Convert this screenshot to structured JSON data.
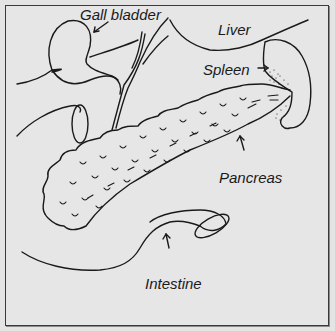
{
  "diagram": {
    "type": "anatomical-illustration",
    "labels": {
      "gall_bladder": "Gall bladder",
      "liver": "Liver",
      "spleen": "Spleen",
      "pancreas": "Pancreas",
      "intestine": "Intestine"
    },
    "colors": {
      "background": "#e6e6e6",
      "ink": "#1a1a1a",
      "border": "#3a3a3a"
    }
  }
}
